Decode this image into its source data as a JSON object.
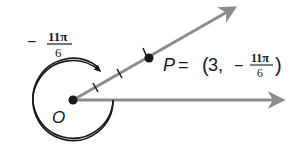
{
  "diagram": {
    "type": "polar-angle",
    "origin_label": "O",
    "angle_label": {
      "sign": "−",
      "numerator": "11π",
      "denominator": "6"
    },
    "point": {
      "name": "P",
      "equals": "=",
      "open_paren": "(",
      "r": "3,",
      "theta_sign": "−",
      "theta_numerator": "11π",
      "theta_denominator": "6",
      "close_paren": ")"
    },
    "colors": {
      "ray": "#8c8c8c",
      "ink": "#1a1a1a"
    }
  }
}
